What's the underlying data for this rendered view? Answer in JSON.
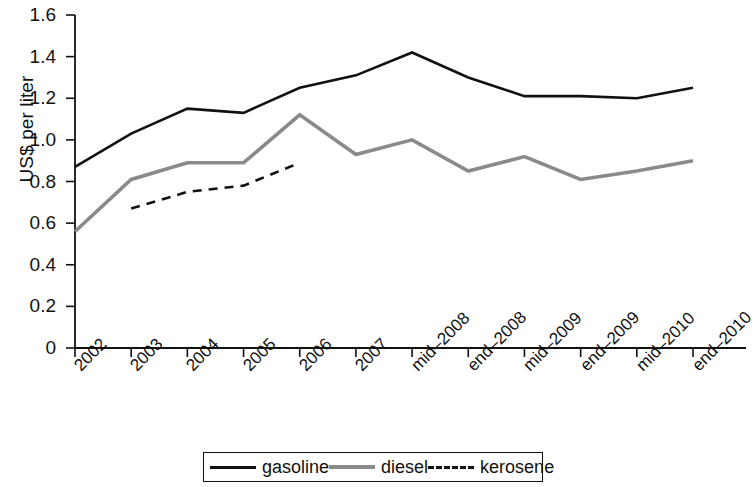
{
  "chart_data": {
    "type": "line",
    "title": "",
    "subtitle": "",
    "xlabel": "",
    "ylabel": "US$ per liter",
    "categories": [
      "2002",
      "2003",
      "2004",
      "2005",
      "2006",
      "2007",
      "mid–2008",
      "end–2008",
      "mid–2009",
      "end–2009",
      "mid–2010",
      "end–2010"
    ],
    "ylim": [
      0,
      1.6
    ],
    "yticks": [
      0,
      0.2,
      0.4,
      0.6,
      0.8,
      1.0,
      1.2,
      1.4,
      1.6
    ],
    "ytick_labels": [
      "0",
      "0.2",
      "0.4",
      "0.6",
      "0.8",
      "1.0",
      "1.2",
      "1.4",
      "1.6"
    ],
    "grid": false,
    "legend_position": "bottom",
    "series": [
      {
        "name": "gasoline",
        "color": "#111111",
        "style": "solid",
        "x": [
          "2002",
          "2003",
          "2004",
          "2005",
          "2006",
          "2007",
          "mid–2008",
          "end–2008",
          "mid–2009",
          "end–2009",
          "mid–2010",
          "end–2010"
        ],
        "values": [
          0.87,
          1.03,
          1.15,
          1.13,
          1.25,
          1.31,
          1.42,
          1.3,
          1.21,
          1.21,
          1.2,
          1.25
        ]
      },
      {
        "name": "diesel",
        "color": "#8a8a8a",
        "style": "solid",
        "x": [
          "2002",
          "2003",
          "2004",
          "2005",
          "2006",
          "2007",
          "mid–2008",
          "end–2008",
          "mid–2009",
          "end–2009",
          "mid–2010",
          "end–2010"
        ],
        "values": [
          0.56,
          0.81,
          0.89,
          0.89,
          1.12,
          0.93,
          1.0,
          0.85,
          0.92,
          0.81,
          0.85,
          0.9
        ]
      },
      {
        "name": "kerosene",
        "color": "#111111",
        "style": "dashed",
        "x": [
          "2003",
          "2004",
          "2005",
          "2006"
        ],
        "values": [
          0.67,
          0.75,
          0.78,
          0.89
        ]
      }
    ]
  },
  "legend": {
    "items": [
      {
        "label": "gasoline",
        "icon": "solid-line-swatch"
      },
      {
        "label": "diesel",
        "icon": "solid-gray-line-swatch"
      },
      {
        "label": "kerosene",
        "icon": "dashed-line-swatch"
      }
    ]
  }
}
